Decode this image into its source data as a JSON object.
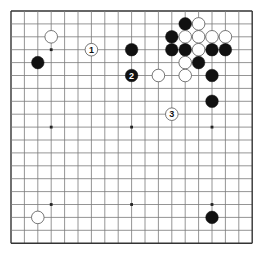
{
  "board": {
    "size": 19,
    "origin_x": 11,
    "origin_y": 11,
    "spacing_x": 13.4,
    "spacing_y": 12.9,
    "stone_radius": 6.3,
    "colors": {
      "background": "#ffffff",
      "line": "#7a7a7a",
      "border": "#333333",
      "hoshi": "#222222",
      "black_stone": "#111111",
      "white_stone": "#ffffff",
      "white_stone_edge": "#555555"
    },
    "hoshi": [
      [
        3,
        3
      ],
      [
        9,
        3
      ],
      [
        15,
        3
      ],
      [
        3,
        9
      ],
      [
        9,
        9
      ],
      [
        15,
        9
      ],
      [
        3,
        15
      ],
      [
        9,
        15
      ],
      [
        15,
        15
      ]
    ],
    "stones": [
      {
        "color": "white",
        "col": 3,
        "row": 2
      },
      {
        "color": "black",
        "col": 2,
        "row": 4
      },
      {
        "color": "white",
        "col": 6,
        "row": 3,
        "label": "1"
      },
      {
        "color": "black",
        "col": 9,
        "row": 3
      },
      {
        "color": "black",
        "col": 9,
        "row": 5,
        "label": "2"
      },
      {
        "color": "white",
        "col": 11,
        "row": 5
      },
      {
        "color": "black",
        "col": 13,
        "row": 1
      },
      {
        "color": "white",
        "col": 14,
        "row": 1
      },
      {
        "color": "black",
        "col": 12,
        "row": 2
      },
      {
        "color": "white",
        "col": 13,
        "row": 2
      },
      {
        "color": "white",
        "col": 14,
        "row": 2
      },
      {
        "color": "white",
        "col": 15,
        "row": 2
      },
      {
        "color": "white",
        "col": 16,
        "row": 2
      },
      {
        "color": "black",
        "col": 12,
        "row": 3
      },
      {
        "color": "black",
        "col": 13,
        "row": 3
      },
      {
        "color": "white",
        "col": 14,
        "row": 3
      },
      {
        "color": "black",
        "col": 15,
        "row": 3
      },
      {
        "color": "black",
        "col": 16,
        "row": 3
      },
      {
        "color": "white",
        "col": 13,
        "row": 4
      },
      {
        "color": "black",
        "col": 14,
        "row": 4
      },
      {
        "color": "white",
        "col": 13,
        "row": 5
      },
      {
        "color": "black",
        "col": 15,
        "row": 5
      },
      {
        "color": "black",
        "col": 15,
        "row": 7
      },
      {
        "color": "white",
        "col": 12,
        "row": 8,
        "label": "3"
      },
      {
        "color": "white",
        "col": 2,
        "row": 16
      },
      {
        "color": "black",
        "col": 15,
        "row": 16
      }
    ]
  }
}
